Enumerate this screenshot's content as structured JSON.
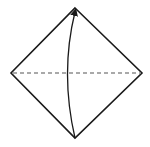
{
  "diagram": {
    "type": "origami-fold-step",
    "background": "#ffffff",
    "stroke_color": "#1a1a1a",
    "paper": {
      "shape": "diamond",
      "vertices": {
        "top": [
          75,
          8
        ],
        "right": [
          142,
          73
        ],
        "bottom": [
          75,
          138
        ],
        "left": [
          11,
          73
        ]
      }
    },
    "fold_line": {
      "style": "dashed",
      "from": [
        11,
        73
      ],
      "to": [
        142,
        73
      ],
      "meaning": "valley-fold"
    },
    "arrow": {
      "from": [
        75,
        138
      ],
      "to": [
        75,
        10
      ],
      "curve_control": [
        60,
        73
      ],
      "meaning": "fold bottom corner up to top corner"
    }
  }
}
